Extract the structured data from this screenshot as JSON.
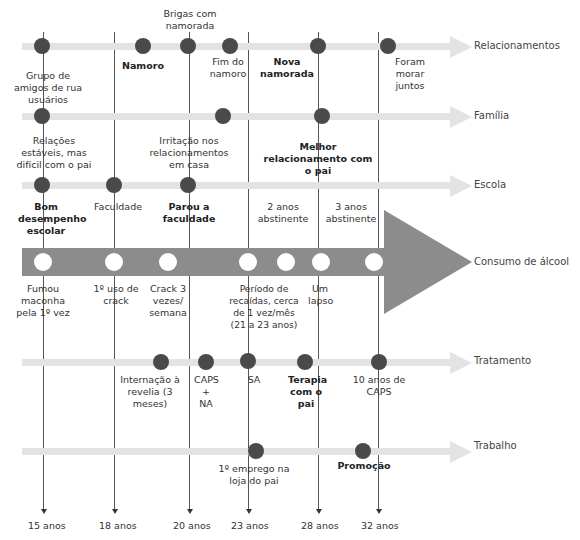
{
  "rows": {
    "relacionamentos": "Relacionamentos",
    "familia": "Família",
    "escola": "Escola",
    "consumo": "Consumo de álcool",
    "tratamento": "Tratamento",
    "trabalho": "Trabalho"
  },
  "ages": [
    "15 anos",
    "18 anos",
    "20 anos",
    "23 anos",
    "28 anos",
    "32 anos"
  ],
  "relacionamentos_events": {
    "brigas": "Brigas com namorada",
    "grupo": "Grupo de amigos de rua usuários",
    "namoro": "Namoro",
    "fim": "Fim do namoro",
    "nova": "Nova namorada",
    "morar": "Foram morar juntos"
  },
  "familia_events": {
    "relacoes": "Relações estáveis, mas difícil com o pai",
    "irritacao": "Irritação nos relacionamentos em casa",
    "melhor": "Melhor relacionamento com o pai"
  },
  "escola_events": {
    "bom": "Bom desempenho escolar",
    "faculdade": "Faculdade",
    "parou": "Parou a faculdade",
    "dois": "2 anos abstinente",
    "tres": "3 anos abstinente"
  },
  "consumo_events": {
    "fumou": "Fumou maconha pela 1º vez",
    "crack1": "1º uso de crack",
    "crack3": "Crack 3 vezes/ semana",
    "recaidas": "Período de recaídas, cerca de 1 vez/mês (21 a 23 anos)",
    "lapso": "Um lapso"
  },
  "tratamento_events": {
    "internacao": "Internação à revelia (3 meses)",
    "caps": "CAPS + NA",
    "sa": "SA",
    "terapia": "Terapia com o pai",
    "dez": "10 anos de CAPS"
  },
  "trabalho_events": {
    "emprego": "1º emprego na loja do pai",
    "promocao": "Promoção"
  },
  "colors": {
    "track": "#e3e3e3",
    "dot": "#4a4a4a",
    "alcohol_arrow": "#8c8c8c"
  }
}
